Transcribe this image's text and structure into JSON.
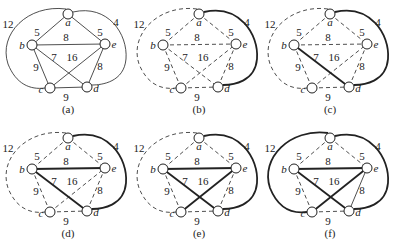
{
  "vertices": [
    {
      "id": "a",
      "x": 68,
      "y": 14,
      "lx": 68,
      "ly": 26
    },
    {
      "id": "b",
      "x": 32,
      "y": 45,
      "lx": 22,
      "ly": 49
    },
    {
      "id": "e",
      "x": 105,
      "y": 44,
      "lx": 114,
      "ly": 48
    },
    {
      "id": "c",
      "x": 50,
      "y": 88,
      "lx": 41,
      "ly": 93
    },
    {
      "id": "d",
      "x": 87,
      "y": 87,
      "lx": 96,
      "ly": 92
    }
  ],
  "edges": [
    {
      "id": "ab",
      "u": "a",
      "v": "b",
      "w": "5",
      "lx": 37,
      "ly": 36
    },
    {
      "id": "ae",
      "u": "a",
      "v": "e",
      "w": "5",
      "lx": 100,
      "ly": 36
    },
    {
      "id": "be",
      "u": "b",
      "v": "e",
      "w": "8",
      "lx": 66,
      "ly": 41
    },
    {
      "id": "bd",
      "u": "b",
      "v": "d",
      "w": "7",
      "lx": 54,
      "ly": 61
    },
    {
      "id": "ce",
      "u": "c",
      "v": "e",
      "w": "16",
      "lx": 72,
      "ly": 61
    },
    {
      "id": "bc",
      "u": "b",
      "v": "c",
      "w": "9",
      "lx": 36,
      "ly": 71
    },
    {
      "id": "ed",
      "u": "e",
      "v": "d",
      "w": "8",
      "lx": 100,
      "ly": 70
    },
    {
      "id": "cd",
      "u": "c",
      "v": "d",
      "w": "9",
      "lx": 66,
      "ly": 101
    },
    {
      "id": "ac",
      "u": "a",
      "v": "c",
      "w": "12",
      "lx": 8,
      "ly": 28,
      "curve": "left"
    },
    {
      "id": "ad",
      "u": "a",
      "v": "d",
      "w": "4",
      "lx": 116,
      "ly": 26,
      "curve": "right"
    }
  ],
  "panels": [
    {
      "caption": "(a)",
      "dx": 0,
      "dy": 0,
      "mode": "all-solid",
      "bold": []
    },
    {
      "caption": "(b)",
      "dx": 131,
      "dy": 0,
      "mode": "dashed",
      "bold": [
        "ad"
      ]
    },
    {
      "caption": "(c)",
      "dx": 262,
      "dy": 0,
      "mode": "dashed",
      "bold": [
        "ad",
        "bd"
      ]
    },
    {
      "caption": "(d)",
      "dx": 0,
      "dy": 124,
      "mode": "dashed",
      "bold": [
        "ad",
        "bd",
        "be"
      ]
    },
    {
      "caption": "(e)",
      "dx": 131,
      "dy": 124,
      "mode": "dashed",
      "bold": [
        "ad",
        "bd",
        "be",
        "ce"
      ]
    },
    {
      "caption": "(f)",
      "dx": 262,
      "dy": 124,
      "mode": "dashed",
      "bold": [
        "ad",
        "bd",
        "be",
        "ce",
        "ac"
      ],
      "thin_solid": [
        "ed"
      ]
    }
  ],
  "colors": {
    "line": "#222222",
    "node_fill": "#ffffff"
  }
}
